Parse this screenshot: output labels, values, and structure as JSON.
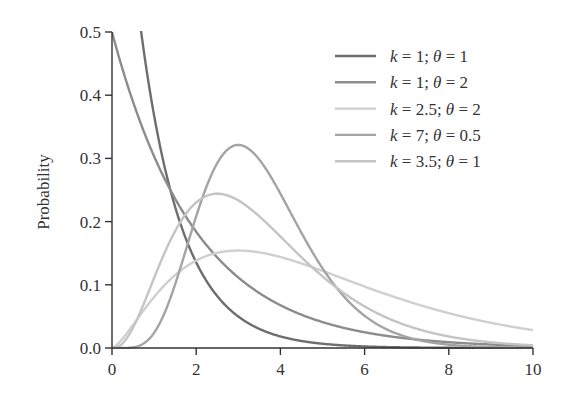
{
  "chart_data": {
    "type": "line",
    "title": "",
    "xlabel": "",
    "ylabel": "Probability",
    "xlim": [
      0,
      10
    ],
    "ylim": [
      0,
      0.5
    ],
    "x_ticks": [
      "0",
      "2",
      "4",
      "6",
      "8",
      "10"
    ],
    "y_ticks": [
      "0.0",
      "0.1",
      "0.2",
      "0.3",
      "0.4",
      "0.5"
    ],
    "grid": false,
    "legend_position": "upper right",
    "x": [
      0,
      0.5,
      1,
      1.5,
      2,
      2.5,
      3,
      3.5,
      4,
      5,
      6,
      7,
      8,
      9,
      10
    ],
    "series": [
      {
        "name": "k = 1; θ = 1",
        "k": 1,
        "theta": 1,
        "color": "#6e6e6e",
        "values": [
          1.0,
          0.607,
          0.368,
          0.223,
          0.135,
          0.082,
          0.05,
          0.03,
          0.018,
          0.007,
          0.002,
          0.001,
          0.0,
          0.0,
          0.0
        ]
      },
      {
        "name": "k = 1; θ = 2",
        "k": 1,
        "theta": 2,
        "color": "#8c8c8c",
        "values": [
          0.5,
          0.389,
          0.303,
          0.236,
          0.184,
          0.143,
          0.112,
          0.087,
          0.068,
          0.041,
          0.025,
          0.015,
          0.009,
          0.006,
          0.003
        ]
      },
      {
        "name": "k = 2.5; θ = 2",
        "k": 2.5,
        "theta": 2,
        "color": "#cfcfcf",
        "values": [
          0.0,
          0.037,
          0.081,
          0.114,
          0.136,
          0.148,
          0.154,
          0.154,
          0.15,
          0.135,
          0.114,
          0.093,
          0.073,
          0.056,
          0.042
        ]
      },
      {
        "name": "k = 7; θ = 0.5",
        "k": 7,
        "theta": 0.5,
        "color": "#a4a4a4",
        "values": [
          0.0,
          0.0,
          0.012,
          0.081,
          0.195,
          0.286,
          0.32,
          0.292,
          0.229,
          0.1,
          0.034,
          0.009,
          0.002,
          0.0,
          0.0
        ]
      },
      {
        "name": "k = 3.5; θ = 1",
        "k": 3.5,
        "theta": 1,
        "color": "#c4c4c4",
        "values": [
          0.0,
          0.041,
          0.111,
          0.177,
          0.219,
          0.235,
          0.229,
          0.205,
          0.175,
          0.115,
          0.07,
          0.041,
          0.023,
          0.012,
          0.006
        ]
      }
    ]
  }
}
